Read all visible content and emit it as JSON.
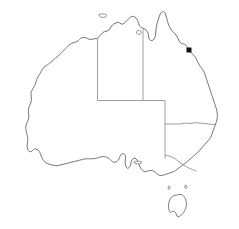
{
  "map": {
    "title": "Australia",
    "type": "outline-map",
    "projection_note": "plain outline, no labels",
    "background_color": "#ffffff",
    "coastline_color": "#5a5a5a",
    "border_color": "#8e8e8e",
    "marker_color": "#111111",
    "regions": [
      {
        "id": "wa",
        "name": "Western Australia"
      },
      {
        "id": "nt",
        "name": "Northern Territory"
      },
      {
        "id": "sa",
        "name": "South Australia"
      },
      {
        "id": "qld",
        "name": "Queensland"
      },
      {
        "id": "nsw",
        "name": "New South Wales"
      },
      {
        "id": "vic",
        "name": "Victoria"
      },
      {
        "id": "tas",
        "name": "Tasmania"
      }
    ],
    "islands": [
      {
        "id": "tasmania",
        "name": "Tasmania"
      },
      {
        "id": "melville",
        "name": "Melville Island"
      },
      {
        "id": "groote",
        "name": "Groote Eylandt"
      },
      {
        "id": "kangaroo",
        "name": "Kangaroo Island"
      },
      {
        "id": "king",
        "name": "King Island"
      },
      {
        "id": "flinders",
        "name": "Flinders Island"
      }
    ],
    "markers": [
      {
        "id": "east-coast-point",
        "name": "marked location",
        "x": 189,
        "y": 50,
        "size": 5
      }
    ],
    "borders": [
      {
        "id": "wa-nt-sa",
        "name": "Western Australia eastern border"
      },
      {
        "id": "nt-qld",
        "name": "Northern Territory eastern border"
      },
      {
        "id": "sa-nt-qld",
        "name": "South Australia northern border"
      },
      {
        "id": "sa-nsw-vic",
        "name": "South Australia eastern border"
      },
      {
        "id": "qld-nsw",
        "name": "Queensland southern border"
      },
      {
        "id": "nsw-vic",
        "name": "New South Wales southern border"
      }
    ]
  }
}
